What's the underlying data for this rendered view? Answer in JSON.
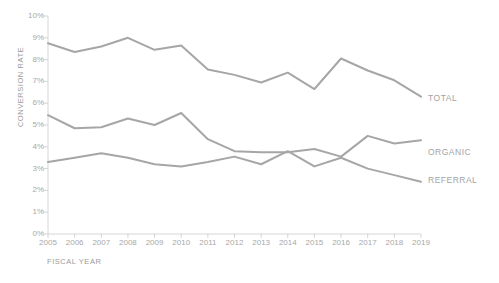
{
  "chart_data": {
    "type": "line",
    "title": "",
    "xlabel": "FISCAL YEAR",
    "ylabel": "CONVERSION RATE",
    "categories": [
      "2005",
      "2006",
      "2007",
      "2008",
      "2009",
      "2010",
      "2011",
      "2012",
      "2013",
      "2014",
      "2015",
      "2016",
      "2017",
      "2018",
      "2019"
    ],
    "x": [
      2005,
      2006,
      2007,
      2008,
      2009,
      2010,
      2011,
      2012,
      2013,
      2014,
      2015,
      2016,
      2017,
      2018,
      2019
    ],
    "ylim": [
      0,
      10
    ],
    "ytick_labels": [
      "0%",
      "1%",
      "2%",
      "3%",
      "4%",
      "5%",
      "6%",
      "7%",
      "8%",
      "9%",
      "10%"
    ],
    "ytick_values": [
      0,
      1,
      2,
      3,
      4,
      5,
      6,
      7,
      8,
      9,
      10
    ],
    "grid": false,
    "legend_position": "right-inline-end-labels",
    "series": [
      {
        "name": "TOTAL",
        "color": "#a6a6a6",
        "values": [
          8.75,
          8.35,
          8.6,
          9.0,
          8.45,
          8.65,
          7.55,
          7.3,
          6.95,
          7.4,
          6.65,
          8.05,
          7.5,
          7.05,
          6.3
        ]
      },
      {
        "name": "ORGANIC",
        "color": "#a6a6a6",
        "values": [
          5.45,
          4.85,
          4.9,
          5.3,
          5.0,
          5.55,
          4.35,
          3.8,
          3.75,
          3.75,
          3.9,
          3.55,
          4.5,
          4.15,
          4.3
        ]
      },
      {
        "name": "REFERRAL",
        "color": "#a6a6a6",
        "values": [
          3.3,
          3.5,
          3.7,
          3.5,
          3.2,
          3.1,
          3.3,
          3.55,
          3.2,
          3.8,
          3.1,
          3.5,
          3.0,
          2.7,
          2.4
        ]
      }
    ]
  },
  "axis": {
    "y_title": "CONVERSION RATE",
    "x_title": "FISCAL YEAR",
    "y_ticks": [
      "10%",
      "9%",
      "8%",
      "7%",
      "6%",
      "5%",
      "4%",
      "3%",
      "2%",
      "1%",
      "0%"
    ],
    "x_ticks": [
      "2005",
      "2006",
      "2007",
      "2008",
      "2009",
      "2010",
      "2011",
      "2012",
      "2013",
      "2014",
      "2015",
      "2016",
      "2017",
      "2018",
      "2019"
    ]
  },
  "series_labels": {
    "total": "TOTAL",
    "organic": "ORGANIC",
    "referral": "REFERRAL"
  },
  "colors": {
    "line": "#a6a6a6",
    "axis": "#d4d4d4",
    "tick_text": "#a8a8a8",
    "title_text": "#9a9a9a",
    "background": "#ffffff"
  }
}
